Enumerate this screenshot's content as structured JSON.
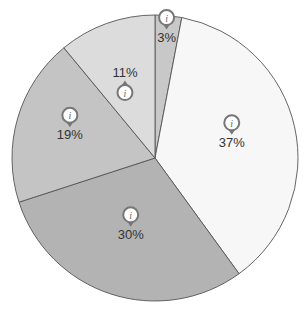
{
  "chart_data": {
    "type": "pie",
    "title": "",
    "categories": [
      "Slice A",
      "Slice B",
      "Slice C",
      "Slice D",
      "Slice E"
    ],
    "values": [
      3,
      37,
      30,
      19,
      11
    ],
    "labels": [
      "3%",
      "37%",
      "30%",
      "19%",
      "11%"
    ],
    "colors": [
      "#c8c8c8",
      "#f7f7f7",
      "#b3b3b3",
      "#c4c4c4",
      "#dcdcdc"
    ],
    "start_angle": "12 o'clock",
    "direction": "clockwise",
    "legend": "none",
    "annotations": "info-pin icon on each slice"
  }
}
